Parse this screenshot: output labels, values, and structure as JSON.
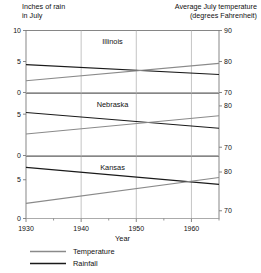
{
  "header": {
    "left_line1": "Inches of rain",
    "left_line2": "in July",
    "right_line1": "Average July temperature",
    "right_line2": "(degrees Fahrenheit)"
  },
  "axis": {
    "x_label": "Year",
    "x_ticks": [
      "1930",
      "1940",
      "1950",
      "1960"
    ]
  },
  "legend": {
    "items": [
      {
        "label": "Temperature",
        "color": "#8a8a8a"
      },
      {
        "label": "Rainfall",
        "color": "#1a1a1a"
      }
    ]
  },
  "colors": {
    "temperature": "#8a8a8a",
    "rainfall": "#1a1a1a",
    "grid": "#b5b5b5",
    "frame": "#7a7a7a",
    "text": "#111111"
  },
  "chart_data": {
    "type": "line",
    "title": "",
    "xlabel": "Year",
    "xlim": [
      1930,
      1965
    ],
    "grid": true,
    "legend_position": "bottom-left",
    "panels": [
      {
        "name": "Illinois",
        "left_axis": {
          "label": "Inches of rain in July",
          "ticks": [
            0,
            5,
            10
          ],
          "lim": [
            0,
            10
          ]
        },
        "right_axis": {
          "label": "Average July temperature (degrees Fahrenheit)",
          "ticks": [
            70,
            80,
            90
          ],
          "lim": [
            70,
            90
          ]
        },
        "series": [
          {
            "name": "Rainfall",
            "axis": "left",
            "x": [
              1930,
              1965
            ],
            "values": [
              4.5,
              2.9
            ]
          },
          {
            "name": "Temperature",
            "axis": "right",
            "x": [
              1930,
              1965
            ],
            "values": [
              73.8,
              79.4
            ]
          }
        ]
      },
      {
        "name": "Nebraska",
        "left_axis": {
          "label": "Inches of rain in July",
          "ticks": [
            0,
            5
          ],
          "lim": [
            0,
            7.5
          ]
        },
        "right_axis": {
          "label": "Average July temperature (degrees Fahrenheit)",
          "ticks": [
            70,
            80
          ],
          "lim": [
            68,
            83
          ]
        },
        "series": [
          {
            "name": "Rainfall",
            "axis": "left",
            "x": [
              1930,
              1965
            ],
            "values": [
              5.2,
              3.3
            ]
          },
          {
            "name": "Temperature",
            "axis": "right",
            "x": [
              1930,
              1965
            ],
            "values": [
              73.2,
              77.6
            ]
          }
        ]
      },
      {
        "name": "Kansas",
        "left_axis": {
          "label": "Inches of rain in July",
          "ticks": [
            0,
            5
          ],
          "lim": [
            0,
            8
          ]
        },
        "right_axis": {
          "label": "Average July temperature (degrees Fahrenheit)",
          "ticks": [
            70,
            80
          ],
          "lim": [
            68,
            84
          ]
        },
        "series": [
          {
            "name": "Rainfall",
            "axis": "left",
            "x": [
              1930,
              1965
            ],
            "values": [
              6.6,
              4.4
            ]
          },
          {
            "name": "Temperature",
            "axis": "right",
            "x": [
              1930,
              1965
            ],
            "values": [
              71.9,
              78.6
            ]
          }
        ]
      }
    ]
  }
}
